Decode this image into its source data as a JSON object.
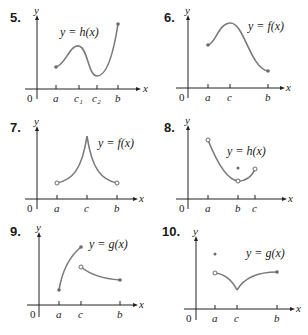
{
  "graphs": [
    {
      "number": "5.",
      "equation": "y = h(x)",
      "ticks": [
        "a",
        "c₁",
        "c₂",
        "b"
      ],
      "x_label": "x",
      "y_label": "y",
      "origin": "0"
    },
    {
      "number": "6.",
      "equation": "y = f(x)",
      "ticks": [
        "a",
        "c",
        "b"
      ],
      "x_label": "x",
      "y_label": "y",
      "origin": "0"
    },
    {
      "number": "7.",
      "equation": "y = f(x)",
      "ticks": [
        "a",
        "c",
        "b"
      ],
      "x_label": "x",
      "y_label": "y",
      "origin": "0"
    },
    {
      "number": "8.",
      "equation": "y = h(x)",
      "ticks": [
        "a",
        "b",
        "c"
      ],
      "x_label": "x",
      "y_label": "y",
      "origin": "0"
    },
    {
      "number": "9.",
      "equation": "y = g(x)",
      "ticks": [
        "a",
        "c",
        "b"
      ],
      "x_label": "x",
      "y_label": "y",
      "origin": "0"
    },
    {
      "number": "10.",
      "equation": "y = g(x)",
      "ticks": [
        "a",
        "c",
        "b"
      ],
      "x_label": "x",
      "y_label": "y",
      "origin": "0"
    }
  ],
  "colors": {
    "curve": "#7a7a7a",
    "axis": "#222222"
  }
}
